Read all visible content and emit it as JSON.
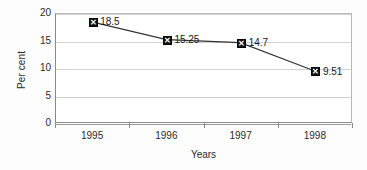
{
  "chart_data": {
    "type": "line",
    "title": "",
    "xlabel": "Years",
    "ylabel": "Per cent",
    "categories": [
      "1995",
      "1996",
      "1997",
      "1998"
    ],
    "values": [
      18.5,
      15.25,
      14.7,
      9.51
    ],
    "point_labels": [
      "18.5",
      "15.25",
      "14.7",
      "9.51"
    ],
    "series": [
      {
        "name": "Per cent",
        "values": [
          18.5,
          15.25,
          14.7,
          9.51
        ]
      }
    ],
    "ylim": [
      0,
      20
    ],
    "yticks": [
      0,
      5,
      10,
      15,
      20
    ],
    "ytick_labels": [
      "0",
      "5",
      "10",
      "15",
      "20"
    ],
    "grid": "horizontal",
    "legend": "none",
    "marker": "filled-square-with-white-x",
    "colors": {
      "line": "#333333",
      "marker_fill": "#111111",
      "marker_glyph": "#ffffff",
      "gridline": "#d2d2d2",
      "axis": "#8a8a8a",
      "plot_background": "#ffffff",
      "text": "#1a1a1a"
    }
  }
}
